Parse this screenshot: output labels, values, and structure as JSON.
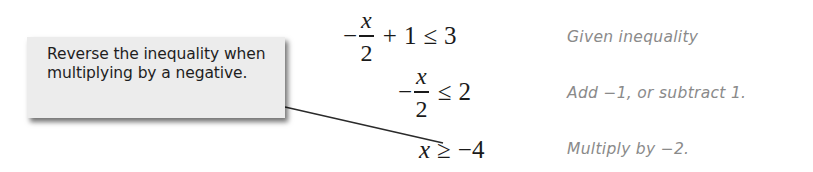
{
  "callout": {
    "text": "Reverse the inequality when multiplying by a negative."
  },
  "steps": [
    {
      "minus": "−",
      "frac_num": "x",
      "frac_den": "2",
      "plus": "+",
      "one": "1",
      "relation": "≤",
      "rhs": "3",
      "note": "Given inequality"
    },
    {
      "minus": "−",
      "frac_num": "x",
      "frac_den": "2",
      "relation": "≤",
      "rhs": "2",
      "note": "Add −1, or subtract 1."
    },
    {
      "lhs": "x",
      "relation": "≥",
      "rhs": "−4",
      "note": "Multiply by −2."
    }
  ],
  "colors": {
    "callout_bg": "#ececec",
    "note_text": "#8a8a8a",
    "math_text": "#1a1a1a"
  }
}
